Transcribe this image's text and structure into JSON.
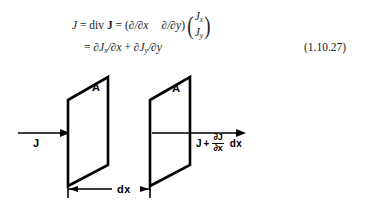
{
  "equation": {
    "line1": {
      "lhs": "J",
      "equals": "=",
      "div_op": "div",
      "div_arg": "J",
      "equals2": "=",
      "open_paren": "(",
      "operator_x": "∂/∂x",
      "operator_y": "∂/∂y",
      "close_paren": ")",
      "vector_top": "J",
      "vector_top_sub": "x",
      "vector_bottom": "J",
      "vector_bottom_sub": "y",
      "paren_left": "(",
      "paren_right": ")"
    },
    "line2": {
      "equals": "=",
      "term1": "∂J",
      "term1_sub": "x",
      "term1_den": "/∂x",
      "plus": "+",
      "term2": "∂J",
      "term2_sub": "y",
      "term2_den": "/∂y"
    },
    "number": "(1.10.27)"
  },
  "figure": {
    "area_label_left": "A",
    "area_label_right": "A",
    "inflow_label": "J",
    "dimension_label": "dx",
    "outflow": {
      "base": "J",
      "plus": "+",
      "numerator": "∂J",
      "denominator": "∂x",
      "suffix": "dx"
    },
    "colors": {
      "stroke": "#000000",
      "background": "#ffffff"
    }
  }
}
